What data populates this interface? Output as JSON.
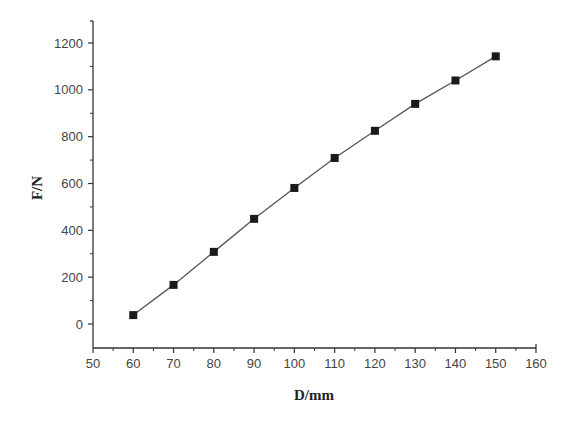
{
  "chart_data": {
    "type": "line",
    "title": "",
    "xlabel": "D/mm",
    "ylabel": "F/N",
    "xlim": [
      50,
      160
    ],
    "ylim": [
      -100,
      1300
    ],
    "x_ticks": [
      50,
      60,
      70,
      80,
      90,
      100,
      110,
      120,
      130,
      140,
      150,
      160
    ],
    "y_ticks": [
      0,
      200,
      400,
      600,
      800,
      1000,
      1200
    ],
    "grid": false,
    "legend": null,
    "series": [
      {
        "name": "F",
        "marker": "filled-square",
        "line": true,
        "x": [
          60,
          70,
          80,
          90,
          100,
          110,
          120,
          130,
          140,
          150
        ],
        "values": [
          38,
          167,
          308,
          449,
          581,
          709,
          825,
          940,
          1040,
          1143
        ]
      }
    ]
  },
  "style": {
    "axis_color": "#333333",
    "line_color": "#555555",
    "marker_color": "#1a1a1a",
    "tick_label_color": "#444444"
  }
}
